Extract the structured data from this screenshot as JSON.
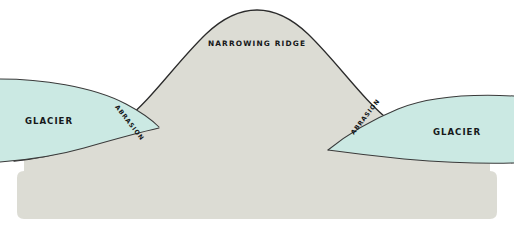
{
  "diagram": {
    "background_color": "#ffffff",
    "ground": {
      "name": "bedrock-ridge",
      "fill_color": "#dcdcd4",
      "outline_color": "#2b2b2b"
    },
    "glaciers": {
      "fill_color": "#cbe9e3",
      "outline_color": "#2b2b2b"
    },
    "labels": {
      "ridge": "NARROWING RIDGE",
      "glacier_left": "GLACIER",
      "glacier_right": "GLACIER",
      "abrasion_left": "ABRASION",
      "abrasion_right": "ABRASION"
    }
  }
}
